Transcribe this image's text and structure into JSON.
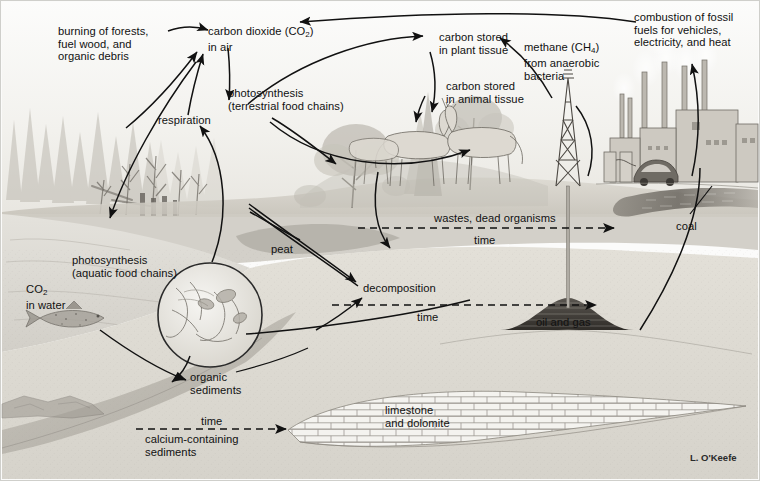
{
  "diagram": {
    "credit": "L. O'Keefe",
    "colors": {
      "ink": "#111111",
      "paper": "#fbfbfa",
      "sky": "#f3f2ef",
      "ground": "#cfccc4",
      "subsurface": "#dedbd3",
      "water": "#dcdad4",
      "coal": "#6e6a63",
      "oil": "#4a4641"
    }
  },
  "labels": {
    "burning": "burning of forests,\nfuel wood, and\norganic debris",
    "co2_air_line1": "carbon dioxide (CO",
    "co2_air_sub": "2",
    "co2_air_line1_end": ")",
    "co2_air_line2": "in air",
    "respiration": "respiration",
    "photosynthesis_terrestrial": "photosynthesis\n(terrestrial food chains)",
    "carbon_plant": "carbon stored\nin plant tissue",
    "carbon_animal": "carbon stored\nin animal tissue",
    "methane_line1": "methane (CH",
    "methane_sub": "4",
    "methane_line1_end": ")",
    "methane_line2": "from anaerobic",
    "methane_line3": "bacteria",
    "combustion": "combustion of fossil\nfuels for vehicles,\nelectricity, and heat",
    "photosynthesis_aquatic": "photosynthesis\n(aquatic food chains)",
    "co2_water_line1": "CO",
    "co2_water_sub": "2",
    "co2_water_line2": "in water",
    "peat": "peat",
    "decomposition": "decomposition",
    "wastes": "wastes, dead organisms",
    "time_1": "time",
    "time_2": "time",
    "time_3": "time",
    "coal": "coal",
    "oil_and_gas": "oil and gas",
    "organic_sediments": "organic\nsediments",
    "calcium_sediments": "calcium-containing\nsediments",
    "limestone": "limestone\nand dolomite"
  },
  "flows": [
    {
      "name": "burning-to-co2",
      "from": "burning of forests, fuel wood, and organic debris",
      "to": "carbon dioxide (CO2) in air",
      "style": "solid"
    },
    {
      "name": "respiration-to-co2",
      "from": "respiration",
      "to": "carbon dioxide (CO2) in air",
      "style": "solid"
    },
    {
      "name": "co2-to-photosynthesis",
      "from": "carbon dioxide (CO2) in air",
      "to": "photosynthesis (terrestrial food chains)",
      "style": "solid"
    },
    {
      "name": "photosynthesis-to-plant-tissue",
      "from": "photosynthesis (terrestrial food chains)",
      "to": "carbon stored in plant tissue",
      "style": "solid"
    },
    {
      "name": "plant-tissue-to-animal-tissue",
      "from": "carbon stored in plant tissue",
      "to": "carbon stored in animal tissue",
      "style": "solid"
    },
    {
      "name": "combustion-to-co2",
      "from": "combustion of fossil fuels",
      "to": "carbon dioxide (CO2) in air",
      "style": "solid"
    },
    {
      "name": "methane-to-air",
      "from": "methane (CH4) from anaerobic bacteria",
      "to": "carbon dioxide (CO2) in air",
      "style": "solid"
    },
    {
      "name": "co2-to-water",
      "from": "carbon dioxide (CO2) in air",
      "to": "CO2 in water",
      "style": "solid"
    },
    {
      "name": "aquatic-photosynthesis-to-respiration",
      "from": "photosynthesis (aquatic food chains)",
      "to": "respiration",
      "style": "solid"
    },
    {
      "name": "organisms-to-decomposition",
      "from": "plants and animals",
      "to": "decomposition",
      "style": "solid"
    },
    {
      "name": "organic-sediments-to-oil",
      "from": "organic sediments",
      "to": "oil and gas",
      "style": "solid"
    },
    {
      "name": "wastes-to-coal",
      "from": "wastes, dead organisms",
      "to": "coal",
      "style": "dashed",
      "annotation": "time"
    },
    {
      "name": "decomposition-to-oil-and-gas",
      "from": "decomposition",
      "to": "oil and gas",
      "style": "dashed",
      "annotation": "time"
    },
    {
      "name": "calcium-sediments-to-limestone",
      "from": "calcium-containing sediments",
      "to": "limestone and dolomite",
      "style": "dashed",
      "annotation": "time"
    },
    {
      "name": "coal-to-combustion",
      "from": "coal",
      "to": "combustion of fossil fuels",
      "style": "solid"
    },
    {
      "name": "oil-to-derrick",
      "from": "oil and gas",
      "to": "combustion of fossil fuels",
      "style": "solid"
    },
    {
      "name": "fish-to-organic-sediments",
      "from": "aquatic organisms",
      "to": "organic sediments",
      "style": "solid"
    }
  ]
}
